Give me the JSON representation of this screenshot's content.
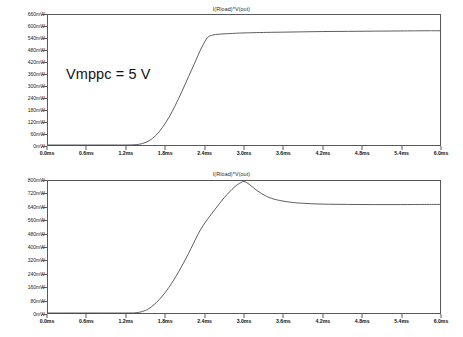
{
  "page": {
    "background": "#ffffff",
    "trace_color": "#3b3f42",
    "axis_color": "#55595c"
  },
  "charts": [
    {
      "id": "top",
      "title": "I(Rload)*V(out)",
      "annotation": "Vmppc = 5 V",
      "xlabel": "",
      "ylabel": "",
      "x_ticks": [
        "0.0ms",
        "0.6ms",
        "1.2ms",
        "1.8ms",
        "2.4ms",
        "3.0ms",
        "3.6ms",
        "4.2ms",
        "4.8ms",
        "5.4ms",
        "6.0ms"
      ],
      "y_ticks": [
        "0mW",
        "60mW",
        "120mW",
        "180mW",
        "240mW",
        "300mW",
        "360mW",
        "420mW",
        "480mW",
        "540mW",
        "600mW",
        "660mW"
      ]
    },
    {
      "id": "bottom",
      "title": "I(Rload)*V(out)",
      "annotation": "Vmppc = 4.5 V",
      "xlabel": "",
      "ylabel": "",
      "x_ticks": [
        "0.0ms",
        "0.6ms",
        "1.2ms",
        "1.8ms",
        "2.4ms",
        "3.0ms",
        "3.6ms",
        "4.2ms",
        "4.8ms",
        "5.4ms",
        "6.0ms"
      ],
      "y_ticks": [
        "0mW",
        "80mW",
        "160mW",
        "240mW",
        "320mW",
        "400mW",
        "480mW",
        "560mW",
        "640mW",
        "720mW",
        "800mW"
      ]
    }
  ],
  "chart_data": [
    {
      "type": "line",
      "title": "I(Rload)*V(out)",
      "subtitle": "Vmppc = 5 V",
      "xlabel": "time (ms)",
      "ylabel": "power (mW)",
      "xlim": [
        0.0,
        6.0
      ],
      "ylim": [
        0,
        660
      ],
      "xtick_values": [
        0.0,
        0.6,
        1.2,
        1.8,
        2.4,
        3.0,
        3.6,
        4.2,
        4.8,
        5.4,
        6.0
      ],
      "ytick_values": [
        0,
        60,
        120,
        180,
        240,
        300,
        360,
        420,
        480,
        540,
        600,
        660
      ],
      "grid": false,
      "legend": "none",
      "series": [
        {
          "name": "I(Rload)*V(out)",
          "x": [
            0.0,
            0.3,
            0.6,
            0.9,
            1.2,
            1.35,
            1.45,
            1.55,
            1.65,
            1.75,
            1.85,
            1.95,
            2.05,
            2.15,
            2.25,
            2.33,
            2.4,
            2.45,
            2.5,
            2.6,
            2.8,
            3.0,
            3.4,
            3.8,
            4.2,
            4.6,
            5.0,
            5.4,
            5.8,
            6.0
          ],
          "y": [
            0,
            0,
            0,
            0,
            0,
            2,
            8,
            22,
            48,
            88,
            140,
            202,
            272,
            346,
            420,
            480,
            525,
            548,
            556,
            562,
            566,
            569,
            572,
            574,
            576,
            577,
            578,
            579,
            580,
            580
          ]
        }
      ]
    },
    {
      "type": "line",
      "title": "I(Rload)*V(out)",
      "subtitle": "Vmppc = 4.5 V",
      "xlabel": "time (ms)",
      "ylabel": "power (mW)",
      "xlim": [
        0.0,
        6.0
      ],
      "ylim": [
        0,
        800
      ],
      "xtick_values": [
        0.0,
        0.6,
        1.2,
        1.8,
        2.4,
        3.0,
        3.6,
        4.2,
        4.8,
        5.4,
        6.0
      ],
      "ytick_values": [
        0,
        80,
        160,
        240,
        320,
        400,
        480,
        560,
        640,
        720,
        800
      ],
      "grid": false,
      "legend": "none",
      "series": [
        {
          "name": "I(Rload)*V(out)",
          "x": [
            0.0,
            0.4,
            0.8,
            1.2,
            1.35,
            1.45,
            1.55,
            1.7,
            1.85,
            2.0,
            2.15,
            2.3,
            2.4,
            2.55,
            2.7,
            2.85,
            2.95,
            3.0,
            3.08,
            3.2,
            3.35,
            3.5,
            3.7,
            3.9,
            4.2,
            4.6,
            5.0,
            5.4,
            5.8,
            6.0
          ],
          "y": [
            0,
            0,
            0,
            0,
            2,
            10,
            28,
            80,
            155,
            250,
            360,
            480,
            545,
            625,
            700,
            762,
            790,
            797,
            780,
            742,
            706,
            686,
            672,
            665,
            660,
            658,
            657,
            657,
            658,
            658
          ]
        }
      ]
    }
  ]
}
